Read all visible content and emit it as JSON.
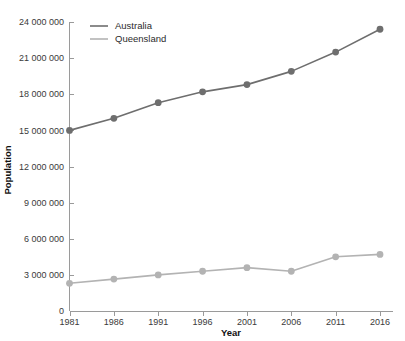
{
  "chart_data": {
    "type": "line",
    "title": "",
    "xlabel": "Year",
    "ylabel": "Population",
    "categories": [
      "1981",
      "1986",
      "1991",
      "1996",
      "2001",
      "2006",
      "2011",
      "2016"
    ],
    "x": [
      1981,
      1986,
      1991,
      1996,
      2001,
      2006,
      2011,
      2016
    ],
    "xlim": [
      1981,
      2016
    ],
    "ylim": [
      0,
      24000000
    ],
    "yticks": [
      0,
      3000000,
      6000000,
      9000000,
      12000000,
      15000000,
      18000000,
      21000000,
      24000000
    ],
    "ytick_labels": [
      "0",
      "3 000 000",
      "6 000 000",
      "9 000 000",
      "12 000 000",
      "15 000 000",
      "18 000 000",
      "21 000 000",
      "24 000 000"
    ],
    "xtick_labels": [
      "1981",
      "1986",
      "1991",
      "1996",
      "2001",
      "2006",
      "2011",
      "2016"
    ],
    "grid": false,
    "legend_position": "top-left",
    "series": [
      {
        "name": "Australia",
        "color": "#6e6e6e",
        "marker": "circle",
        "values": [
          15000000,
          16000000,
          17300000,
          18200000,
          18800000,
          19900000,
          21500000,
          23400000
        ]
      },
      {
        "name": "Queensland",
        "color": "#b3b3b3",
        "marker": "circle",
        "values": [
          2300000,
          2650000,
          3000000,
          3300000,
          3600000,
          3300000,
          4500000,
          4700000
        ]
      }
    ]
  },
  "axis": {
    "x_title": "Year",
    "y_title": "Population"
  },
  "legend": {
    "items": [
      {
        "label": "Australia",
        "color": "#6e6e6e"
      },
      {
        "label": "Queensland",
        "color": "#b3b3b3"
      }
    ]
  }
}
